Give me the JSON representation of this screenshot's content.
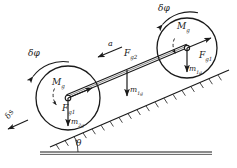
{
  "figure": {
    "type": "free-body-diagram",
    "stroke_color": "#1a1a1a",
    "background_color": "#ffffff",
    "incline_angle_label": "θ"
  },
  "labels": {
    "delta_phi_right": {
      "text": "δφ",
      "x": 158,
      "y": 6,
      "rotate": 0
    },
    "delta_phi_left": {
      "text": "δφ",
      "x": 28,
      "y": 51,
      "rotate": 0
    },
    "delta_s": {
      "text": "δs",
      "x": 5,
      "y": 119,
      "rotate": -60
    },
    "moment_right": {
      "text": "M",
      "sub": "g",
      "x": 177,
      "y": 24
    },
    "moment_left": {
      "text": "M",
      "sub": "g",
      "x": 52,
      "y": 80
    },
    "force_g1_right": {
      "text": "F",
      "sub": "g1",
      "x": 200,
      "y": 53
    },
    "force_g1_left": {
      "text": "F",
      "sub": "g1",
      "x": 63,
      "y": 106
    },
    "force_g2_mid": {
      "text": "F",
      "sub": "g2",
      "x": 122,
      "y": 51
    },
    "accel": {
      "text": "a",
      "x": 107,
      "y": 44
    },
    "weight_m1g_right": {
      "text": "m",
      "sub": "1g",
      "x": 188,
      "y": 67
    },
    "weight_m1g_mid": {
      "text": "m",
      "sub": "1g",
      "x": 128,
      "y": 88
    },
    "weight_m2g_left": {
      "text": "m",
      "sub": "2g",
      "x": 58,
      "y": 120
    },
    "theta": {
      "text": "θ",
      "x": 76,
      "y": 146
    }
  },
  "geometry": {
    "right_wheel": {
      "cx": 187,
      "cy": 48,
      "r": 30
    },
    "left_wheel": {
      "cx": 68,
      "cy": 98,
      "r": 32
    },
    "rod": {
      "x1": 68,
      "y1": 98,
      "x2": 187,
      "y2": 48
    },
    "incline_line": {
      "x1": 52,
      "y1": 146,
      "x2": 228,
      "y2": 71
    },
    "ground_line": {
      "x1": 42,
      "y1": 152,
      "x2": 210,
      "y2": 152
    }
  }
}
